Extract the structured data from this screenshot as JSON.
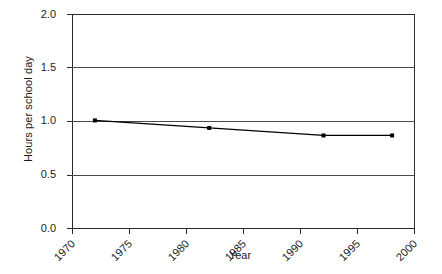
{
  "chart_data": {
    "type": "line",
    "title": "",
    "xlabel": "Year",
    "ylabel": "Hours per school day",
    "xlim": [
      1970,
      2000
    ],
    "ylim": [
      0.0,
      2.0
    ],
    "grid": true,
    "legend": "none",
    "x_ticks": [
      1970,
      1975,
      1980,
      1985,
      1990,
      1995,
      2000
    ],
    "x_tick_labels": [
      "1970",
      "1975",
      "1980",
      "1985",
      "1990",
      "1995",
      "2000"
    ],
    "y_ticks": [
      0.0,
      0.5,
      1.0,
      1.5,
      2.0
    ],
    "y_tick_labels": [
      "0.0",
      "0.5",
      "1.0",
      "1.5",
      "2.0"
    ],
    "series": [
      {
        "name": "Hours per school day",
        "marker": "square",
        "color": "#000000",
        "x": [
          1972,
          1982,
          1992,
          1998
        ],
        "values": [
          1.01,
          0.94,
          0.87,
          0.87
        ]
      }
    ]
  },
  "axes": {
    "y_title": "Hours per school day",
    "x_title": "Year"
  }
}
